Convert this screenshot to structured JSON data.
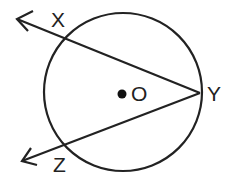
{
  "diagram": {
    "type": "geometry",
    "colors": {
      "stroke": "#222222",
      "background": "#ffffff"
    },
    "circle": {
      "center_label": "O",
      "cx": 123,
      "cy": 92,
      "r": 79
    },
    "points": [
      {
        "id": "X",
        "label": "X",
        "x": 58,
        "y": 30
      },
      {
        "id": "Y",
        "label": "Y",
        "x": 200,
        "y": 93
      },
      {
        "id": "Z",
        "label": "Z",
        "x": 58,
        "y": 145
      },
      {
        "id": "O",
        "label": "O",
        "x": 122,
        "y": 94
      }
    ],
    "rays": [
      {
        "from": "Y",
        "through": "X",
        "label": "ray YX"
      },
      {
        "from": "Y",
        "through": "Z",
        "label": "ray YZ"
      }
    ],
    "labels": {
      "X": "X",
      "Y": "Y",
      "Z": "Z",
      "O": "O"
    }
  }
}
